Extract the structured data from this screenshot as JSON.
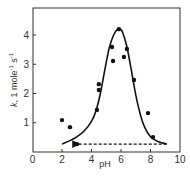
{
  "chart_data": {
    "type": "scatter",
    "title": "",
    "xlabel": "pH",
    "ylabel": "k, 1 mole⁻¹ s⁻¹",
    "xlim": [
      0,
      10
    ],
    "ylim": [
      0,
      4.9
    ],
    "x_ticks": [
      0,
      2,
      4,
      6,
      8,
      10
    ],
    "y_ticks": [
      1,
      2,
      3,
      4
    ],
    "grid": false,
    "legend": null,
    "series": [
      {
        "name": "data points",
        "kind": "scatter",
        "x": [
          2.0,
          2.54,
          3.02,
          4.37,
          4.5,
          4.5,
          5.39,
          5.46,
          5.86,
          6.2,
          6.4,
          6.88,
          7.83,
          8.17
        ],
        "y": [
          1.09,
          0.85,
          0.27,
          1.44,
          2.12,
          2.32,
          3.59,
          3.11,
          4.2,
          3.25,
          3.52,
          2.46,
          1.33,
          0.51
        ]
      },
      {
        "name": "fitted curve",
        "kind": "line",
        "style": "solid",
        "x": [
          2.0,
          2.5,
          3.0,
          3.5,
          4.0,
          4.3,
          4.6,
          4.9,
          5.2,
          5.5,
          5.8,
          5.95,
          6.1,
          6.4,
          6.7,
          7.0,
          7.3,
          7.6,
          8.0,
          8.5,
          9.1
        ],
        "y": [
          0.27,
          0.38,
          0.52,
          0.72,
          1.05,
          1.4,
          2.0,
          2.8,
          3.55,
          4.0,
          4.22,
          4.2,
          4.1,
          3.6,
          2.8,
          1.95,
          1.3,
          0.85,
          0.52,
          0.36,
          0.27
        ]
      },
      {
        "name": "baseline",
        "kind": "line",
        "style": "dashed",
        "arrow": "left",
        "x": [
          3.0,
          9.1
        ],
        "y": [
          0.27,
          0.27
        ]
      }
    ]
  },
  "axes": {
    "x_label": "pH",
    "y_label_k": "k",
    "y_label_rest": ", 1 mole",
    "y_label_sup1": "-1",
    "y_label_s": " s",
    "y_label_sup2": "-1",
    "x_tick_labels": [
      "0",
      "2",
      "4",
      "6",
      "8",
      "10"
    ],
    "y_tick_labels": [
      "1",
      "2",
      "3",
      "4"
    ]
  },
  "colors": {
    "ink": "#111111",
    "frame": "#333333",
    "background": "#ffffff"
  }
}
